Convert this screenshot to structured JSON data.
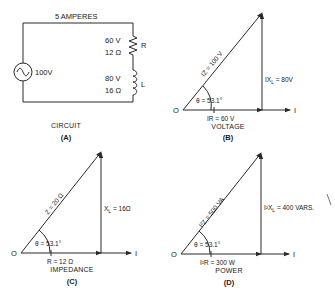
{
  "circuit": {
    "current_label": "5 AMPERES",
    "source_label": "100V",
    "resistor": {
      "voltage": "60 V",
      "value": "12 Ω",
      "symbol": "R"
    },
    "inductor": {
      "voltage": "80 V",
      "value": "16 Ω",
      "symbol": "L"
    },
    "caption": "CIRCUIT",
    "letter": "(A)"
  },
  "voltage": {
    "origin": "O",
    "hypotenuse": "IZ = 100 V",
    "base": "IR = 60 V",
    "vertical": "IXL = 80V",
    "vertical_main": "IX",
    "vertical_sub": "L",
    "vertical_rest": " = 80V",
    "angle": "θ = 53.1°",
    "axis": "I",
    "caption": "VOLTAGE",
    "letter": "(B)"
  },
  "impedance": {
    "origin": "O",
    "hypotenuse": "Z = 20 Ω",
    "base": "R = 12 Ω",
    "vertical_main": "X",
    "vertical_sub": "L",
    "vertical_rest": " = 16Ω",
    "angle": "θ = 53.1°",
    "axis": "I",
    "caption": "IMPEDANCE",
    "letter": "(C)"
  },
  "power": {
    "origin": "O",
    "hypotenuse": "I²Z = 500 VA",
    "base": "I²R = 300 W",
    "vertical_main": "I²X",
    "vertical_sub": "L",
    "vertical_rest": " = 400 VARS.",
    "angle": "θ = 53.1°",
    "axis": "I",
    "caption": "POWER",
    "letter": "(D)"
  },
  "colors": {
    "ink": "#2a2a2a",
    "background": "#ffffff"
  }
}
